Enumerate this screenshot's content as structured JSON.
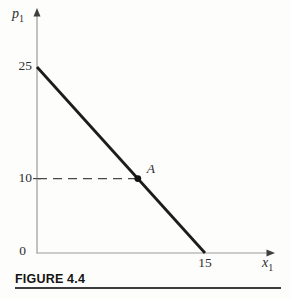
{
  "figure": {
    "caption": "FIGURE 4.4"
  },
  "chart_data": {
    "type": "line",
    "title": "FIGURE 4.4",
    "xlabel": {
      "base": "x",
      "sub": "1"
    },
    "ylabel": {
      "base": "p",
      "sub": "1"
    },
    "xlim": [
      0,
      18
    ],
    "ylim": [
      0,
      28
    ],
    "x_ticks": [
      {
        "value": 15,
        "label": "15"
      }
    ],
    "y_ticks": [
      {
        "value": 25,
        "label": "25"
      },
      {
        "value": 10,
        "label": "10"
      }
    ],
    "origin_label": "0",
    "grid": false,
    "series": [
      {
        "name": "demand-line",
        "x": [
          0,
          15
        ],
        "y": [
          25,
          0
        ],
        "color": "#1c1c1c",
        "width": 2.8
      }
    ],
    "annotations": [
      {
        "type": "point",
        "x": 9,
        "y": 10,
        "label": "A",
        "color": "#141414"
      },
      {
        "type": "dashed-guide",
        "x1": 0,
        "y1": 10,
        "x2": 9,
        "y2": 10,
        "color": "#4a4a4a"
      }
    ],
    "colors": {
      "axis": "#9b9b9b",
      "arrow": "#3f3f3f",
      "text": "#2e2e2e"
    }
  }
}
